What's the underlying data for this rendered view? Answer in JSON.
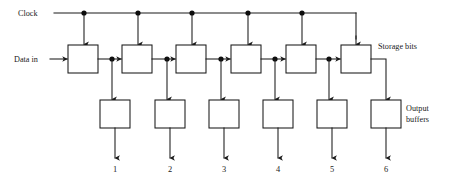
{
  "diagram": {
    "labels": {
      "clock": "Clock",
      "data_in": "Data in",
      "storage_bits": "Storage bits",
      "output_buffers_line1": "Output",
      "output_buffers_line2": "buffers"
    },
    "colors": {
      "line": "#1a1a1a",
      "box_fill": "#ffffff",
      "junction": "#0d0d0d",
      "background": "#ffffff"
    },
    "stages": [
      {
        "index": 1,
        "output_label": "1"
      },
      {
        "index": 2,
        "output_label": "2"
      },
      {
        "index": 3,
        "output_label": "3"
      },
      {
        "index": 4,
        "output_label": "4"
      },
      {
        "index": 5,
        "output_label": "5"
      },
      {
        "index": 6,
        "output_label": "6"
      }
    ],
    "geometry": {
      "storage_boxes_x": [
        68,
        122,
        176,
        231,
        286,
        341
      ],
      "storage_box_y": 45,
      "storage_box_w": 30,
      "storage_box_h": 28,
      "buffer_boxes_x": [
        100,
        155,
        209,
        263,
        317,
        371
      ],
      "buffer_box_y": 100,
      "buffer_box_w": 30,
      "buffer_box_h": 28,
      "clock_line_y": 13,
      "clock_junctions_x": [
        84,
        138,
        192,
        248,
        302
      ],
      "clock_turn_x": 356,
      "data_line_y": 59,
      "tap_dots_x": [
        112,
        167,
        221,
        275,
        329
      ],
      "output_label_y": 170
    }
  }
}
